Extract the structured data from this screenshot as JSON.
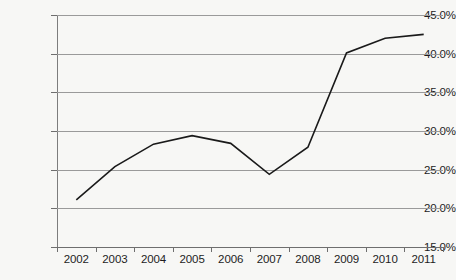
{
  "chart_data": {
    "type": "line",
    "title": "",
    "xlabel": "",
    "ylabel": "",
    "categories": [
      "2002",
      "2003",
      "2004",
      "2005",
      "2006",
      "2007",
      "2008",
      "2009",
      "2010",
      "2011"
    ],
    "values": [
      21.1,
      25.4,
      28.3,
      29.4,
      28.4,
      24.4,
      27.9,
      40.1,
      42.0,
      42.5
    ],
    "series": [
      {
        "name": "",
        "values": [
          21.1,
          25.4,
          28.3,
          29.4,
          28.4,
          24.4,
          27.9,
          40.1,
          42.0,
          42.5
        ]
      }
    ],
    "ylim": [
      15.0,
      45.0
    ],
    "ytick_values": [
      15.0,
      20.0,
      25.0,
      30.0,
      35.0,
      40.0,
      45.0
    ],
    "ytick_labels": [
      "15.0%",
      "20.0%",
      "25.0%",
      "30.0%",
      "35.0%",
      "40.0%",
      "45.0%"
    ],
    "xtick_labels": [
      "2002",
      "2003",
      "2004",
      "2005",
      "2006",
      "2007",
      "2008",
      "2009",
      "2010",
      "2011"
    ],
    "grid": true,
    "legend": "none",
    "value_suffix": "%",
    "line_color": "#1a1a1a",
    "grid_color": "#9a9a9a",
    "axis_color": "#6e6e6e",
    "background_color": "#f7f7f5",
    "text_color": "#1d1d1d"
  }
}
